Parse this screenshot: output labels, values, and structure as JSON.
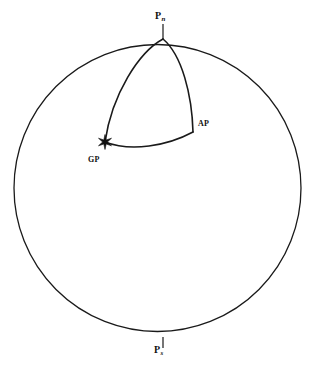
{
  "figure": {
    "kind": "navigational-triangle-diagram",
    "width": 316,
    "height": 365,
    "background_color": "#ffffff",
    "stroke_color": "#1a1a1a",
    "label_color": "#111111"
  },
  "sphere": {
    "name": "earth-outline-circle",
    "center_x": 157.5,
    "center_y": 188,
    "radius": 143.5,
    "stroke_width": 1.3
  },
  "labels": {
    "north_pole": {
      "text": "P",
      "subscript": "n",
      "full": "Pn",
      "meaning": "north-pole"
    },
    "south_pole": {
      "text": "P",
      "subscript": "s",
      "full": "Ps",
      "meaning": "south-pole"
    },
    "assumed_position": {
      "text": "AP",
      "meaning": "assumed-position"
    },
    "geographic_position": {
      "text": "GP",
      "meaning": "geographic-position"
    }
  },
  "points": [
    {
      "id": "pn",
      "label": "Pn",
      "x": 163,
      "y": 39,
      "marker": "none"
    },
    {
      "id": "ps",
      "label": "Ps",
      "x": 163,
      "y": 337,
      "marker": "none"
    },
    {
      "id": "ap",
      "label": "AP",
      "x": 193,
      "y": 132,
      "marker": "none"
    },
    {
      "id": "gp",
      "label": "GP",
      "x": 105,
      "y": 142,
      "marker": "star"
    }
  ],
  "arcs": [
    {
      "id": "pn-gp",
      "name": "arc-pole-to-geographic-position",
      "from": "pn",
      "to": "gp",
      "path": "M 163 39 C 139 52 112 94 105 142",
      "stroke_width": 1.6
    },
    {
      "id": "pn-ap",
      "name": "arc-pole-to-assumed-position",
      "from": "pn",
      "to": "ap",
      "path": "M 163 39 C 182 55 192 95 193 132",
      "stroke_width": 1.6
    },
    {
      "id": "gp-ap",
      "name": "arc-geographic-position-to-assumed-position",
      "from": "gp",
      "to": "ap",
      "path": "M 105 142 C 131 152 167 146 193 132",
      "stroke_width": 1.6
    }
  ],
  "ticks": [
    {
      "id": "pn-tick",
      "name": "north-pole-tick",
      "x1": 163,
      "y1": 24,
      "x2": 163,
      "y2": 39
    },
    {
      "id": "ps-tick",
      "name": "south-pole-tick",
      "x1": 163,
      "y1": 337,
      "x2": 163,
      "y2": 348
    }
  ],
  "star_marker": {
    "name": "gp-star-marker",
    "center_x": 105,
    "center_y": 142,
    "outer_radius": 7.5,
    "inner_radius": 2.4,
    "points": 6
  }
}
